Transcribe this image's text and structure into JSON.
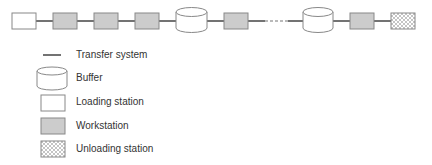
{
  "diagram": {
    "colors": {
      "line": "#444444",
      "stroke": "#888888",
      "workstation_fill": "#cccccc",
      "loading_fill": "#ffffff",
      "buffer_fill": "#ffffff",
      "unloading_pattern": "#aaaaaa"
    },
    "sequence": [
      {
        "type": "loading_station"
      },
      {
        "type": "workstation"
      },
      {
        "type": "workstation"
      },
      {
        "type": "workstation"
      },
      {
        "type": "buffer"
      },
      {
        "type": "workstation"
      },
      {
        "type": "ellipsis"
      },
      {
        "type": "buffer"
      },
      {
        "type": "workstation"
      },
      {
        "type": "unloading_station"
      }
    ]
  },
  "legend": {
    "items": [
      {
        "symbol": "transfer-line",
        "label": "Transfer system"
      },
      {
        "symbol": "buffer-cylinder",
        "label": "Buffer"
      },
      {
        "symbol": "white-box",
        "label": "Loading station"
      },
      {
        "symbol": "gray-box",
        "label": "Workstation"
      },
      {
        "symbol": "hatched-box",
        "label": "Unloading station"
      }
    ]
  }
}
